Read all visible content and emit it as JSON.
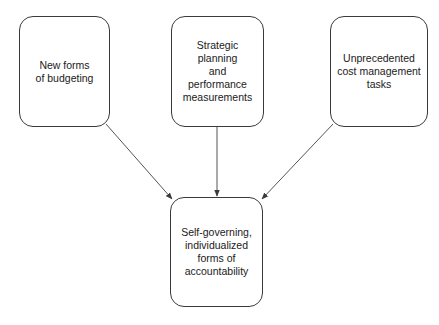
{
  "diagram": {
    "type": "flow",
    "nodes": [
      {
        "id": "n1",
        "label": "New forms\nof budgeting"
      },
      {
        "id": "n2",
        "label": "Strategic planning\nand\nperformance\nmeasurements"
      },
      {
        "id": "n3",
        "label": "Unprecedented\ncost management\ntasks"
      },
      {
        "id": "n4",
        "label": "Self-governing,\nindividualized\nforms of\naccountability"
      }
    ],
    "edges": [
      {
        "from": "n1",
        "to": "n4"
      },
      {
        "from": "n2",
        "to": "n4"
      },
      {
        "from": "n3",
        "to": "n4"
      }
    ],
    "colors": {
      "stroke": "#3a3a3a",
      "text": "#1a1a1a",
      "background": "#ffffff"
    }
  }
}
